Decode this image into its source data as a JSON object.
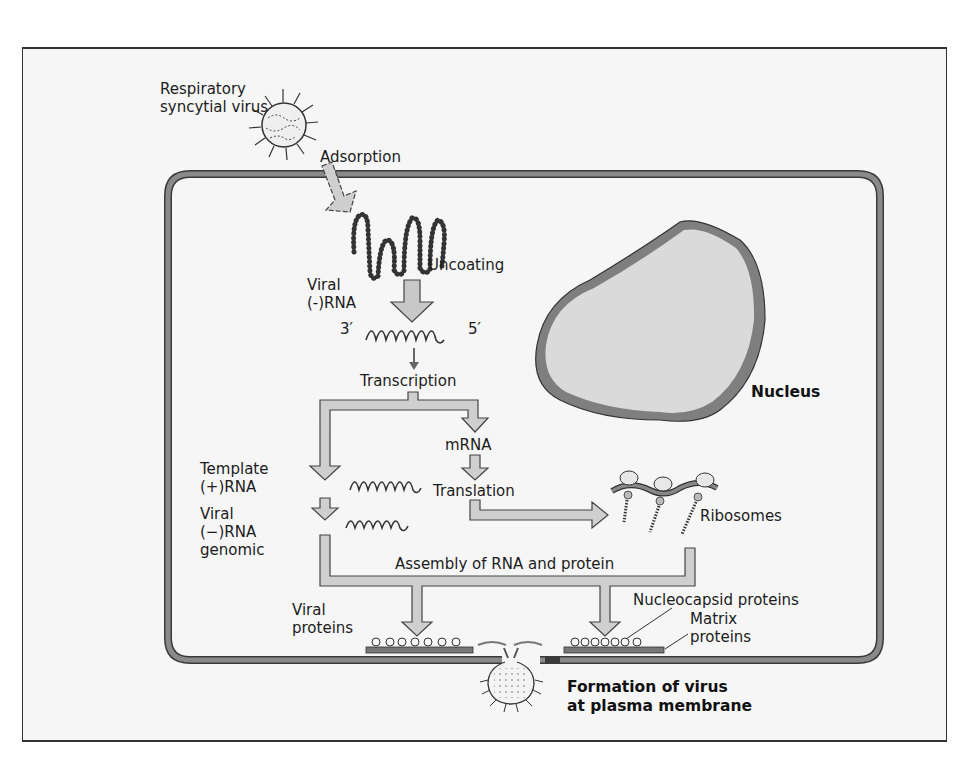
{
  "figure": {
    "colors": {
      "background": "#f6f6f6",
      "membrane": "#7a7a7a",
      "arrow_fill": "#c8c8c8",
      "nucleus_fill": "#d9d9d9",
      "nucleus_rim": "#808080"
    }
  },
  "labels": {
    "virus": [
      "Respiratory",
      "syncytial virus"
    ],
    "adsorption": "Adsorption",
    "uncoating": "Uncoating",
    "viral_neg_rna": [
      "Viral",
      "(-)RNA"
    ],
    "three_prime": "3′",
    "five_prime": "5′",
    "transcription": "Transcription",
    "mrna": "mRNA",
    "translation": "Translation",
    "template_pos_rna": [
      "Template",
      "(+)RNA"
    ],
    "viral_neg_rna_genomic": [
      "Viral",
      "(−)RNA",
      "genomic"
    ],
    "ribosomes": "Ribosomes",
    "nucleus": "Nucleus",
    "assembly": "Assembly of RNA and protein",
    "viral_proteins": [
      "Viral",
      "proteins"
    ],
    "nucleocapsid_proteins": "Nucleocapsid proteins",
    "matrix_proteins": [
      "Matrix",
      "proteins"
    ],
    "formation": [
      "Formation of virus",
      "at plasma membrane"
    ]
  }
}
